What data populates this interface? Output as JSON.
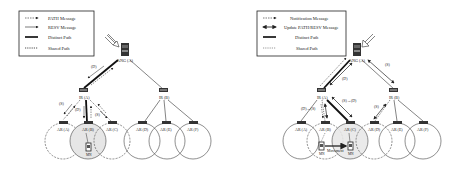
{
  "left_diagram": {
    "legend": [
      {
        "style": "dashed-arrow",
        "label": "PATH Message"
      },
      {
        "style": "solid-arrow",
        "label": "RESV Message"
      },
      {
        "style": "thick-line",
        "label": "Distinct Path"
      },
      {
        "style": "dotted-line",
        "label": "Shared Path"
      }
    ],
    "nodes": {
      "ang": "ANG (A)",
      "ir_a": "IR (A)",
      "ir_b": "IR (B)",
      "ar_a": "AR (A)",
      "ar_b": "AR (B)",
      "ar_c": "AR (C)",
      "ar_d": "AR (D)",
      "ar_e": "AR (E)",
      "ar_f": "AR (F)",
      "mn": "MN"
    },
    "edge_labels": {
      "ang_ir_a": "(D)",
      "ir_a_ar_a": "(S)",
      "ir_a_ar_b": "(D)",
      "ir_a_ar_c": "(S)"
    }
  },
  "right_diagram": {
    "legend": [
      {
        "style": "dashed-arrow",
        "label": "Notification Message"
      },
      {
        "style": "double-arrow",
        "label": "Update PATH/RESV Message"
      },
      {
        "style": "thick-line",
        "label": "Distinct Path"
      },
      {
        "style": "dotted-line",
        "label": "Shared Path"
      }
    ],
    "nodes": {
      "ang": "ANG (A)",
      "ir_a": "IR (A)",
      "ir_b": "IR (B)",
      "ar_a": "AR (A)",
      "ar_b": "AR (B)",
      "ar_c": "AR (C)",
      "ar_d": "AR (D)",
      "ar_e": "AR (E)",
      "ar_f": "AR (F)",
      "mn_left": "MN",
      "mn_right": "MN"
    },
    "edge_labels": {
      "ang_ir_a": "(D)",
      "ang_ir_b": "(S)",
      "ir_a_ar_b": "(D)→(S)",
      "ir_a_ar_c": "(S)→(D)",
      "ir_b_ar_d": "(S)"
    },
    "movement_label": "Movement"
  }
}
